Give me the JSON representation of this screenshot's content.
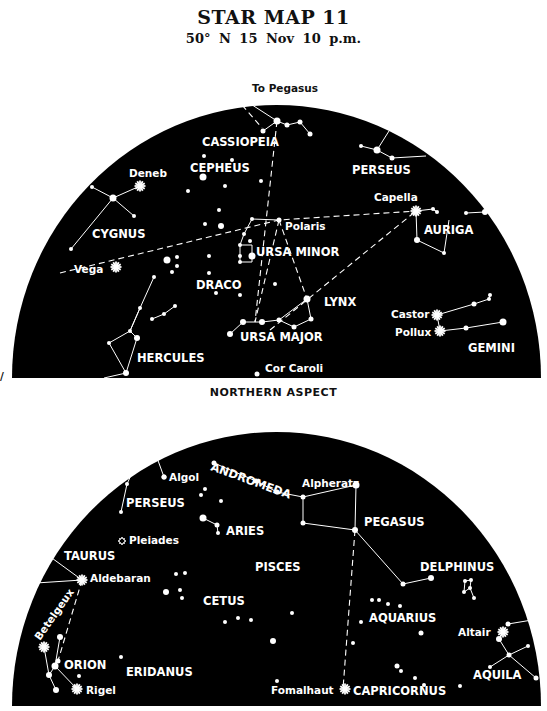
{
  "header": {
    "title": "STAR MAP 11",
    "subtitle": "50° N   15 Nov   10 p.m."
  },
  "colors": {
    "sky": "#000000",
    "star": "#ffffff",
    "paper": "#ffffff",
    "ink": "#111111"
  },
  "northern": {
    "aspect_label": "NORTHERN ASPECT",
    "dome": {
      "left": 12,
      "right": 541,
      "top": 105,
      "bottom": 378
    },
    "pointer_label": "To Pegasus",
    "constellations": [
      {
        "name": "CASSIOPEIA",
        "x": 202,
        "y": 146
      },
      {
        "name": "CEPHEUS",
        "x": 190,
        "y": 172
      },
      {
        "name": "PERSEUS",
        "x": 352,
        "y": 174
      },
      {
        "name": "CYGNUS",
        "x": 92,
        "y": 238
      },
      {
        "name": "AURIGA",
        "x": 424,
        "y": 234
      },
      {
        "name": "URSA MINOR",
        "x": 256,
        "y": 256
      },
      {
        "name": "DRACO",
        "x": 196,
        "y": 289
      },
      {
        "name": "LYNX",
        "x": 324,
        "y": 306
      },
      {
        "name": "URSA MAJOR",
        "x": 240,
        "y": 341
      },
      {
        "name": "HERCULES",
        "x": 137,
        "y": 362
      },
      {
        "name": "GEMINI",
        "x": 468,
        "y": 352
      }
    ],
    "named_stars": [
      {
        "name": "Deneb",
        "x": 129,
        "y": 177,
        "sx": 140,
        "sy": 186,
        "bright": true
      },
      {
        "name": "Capella",
        "x": 374,
        "y": 201,
        "sx": 416,
        "sy": 211,
        "bright": true
      },
      {
        "name": "Polaris",
        "x": 285,
        "y": 230,
        "sx": 279,
        "sy": 220,
        "bright": false
      },
      {
        "name": "Vega",
        "x": 74,
        "y": 273,
        "sx": 116,
        "sy": 267,
        "bright": true
      },
      {
        "name": "Castor",
        "x": 391,
        "y": 318,
        "sx": 437,
        "sy": 315,
        "bright": true
      },
      {
        "name": "Pollux",
        "x": 395,
        "y": 336,
        "sx": 440,
        "sy": 331,
        "bright": true
      },
      {
        "name": "Cor Caroli",
        "x": 265,
        "y": 372,
        "sx": 257,
        "sy": 374,
        "bright": false
      }
    ],
    "stars": [
      [
        277,
        121,
        3.5
      ],
      [
        263,
        131,
        2.5
      ],
      [
        287,
        125,
        2.5
      ],
      [
        300,
        122,
        2.5
      ],
      [
        310,
        134,
        2.5
      ],
      [
        204,
        156,
        2
      ],
      [
        232,
        160,
        2
      ],
      [
        203,
        177,
        3.5
      ],
      [
        225,
        186,
        2
      ],
      [
        261,
        181,
        2
      ],
      [
        188,
        191,
        2
      ],
      [
        219,
        210,
        2
      ],
      [
        205,
        224,
        2
      ],
      [
        221,
        226,
        3
      ],
      [
        361,
        146,
        2
      ],
      [
        377,
        150,
        3.5
      ],
      [
        392,
        158,
        2.5
      ],
      [
        92,
        187,
        2
      ],
      [
        113,
        198,
        3.5
      ],
      [
        134,
        216,
        2
      ],
      [
        71,
        249,
        2
      ],
      [
        433,
        209,
        2
      ],
      [
        437,
        212,
        2
      ],
      [
        466,
        213,
        2
      ],
      [
        485,
        212,
        3
      ],
      [
        417,
        240,
        3
      ],
      [
        444,
        253,
        2
      ],
      [
        252,
        219,
        2
      ],
      [
        244,
        234,
        2
      ],
      [
        240,
        245,
        2
      ],
      [
        240,
        256,
        2
      ],
      [
        252,
        256,
        3.5
      ],
      [
        240,
        262,
        2
      ],
      [
        167,
        260,
        3.5
      ],
      [
        177,
        257,
        2
      ],
      [
        177,
        266,
        2
      ],
      [
        172,
        272,
        2
      ],
      [
        209,
        256,
        2
      ],
      [
        209,
        273,
        2
      ],
      [
        216,
        293,
        2
      ],
      [
        240,
        295,
        2
      ],
      [
        250,
        241,
        2
      ],
      [
        275,
        284,
        2
      ],
      [
        307,
        299,
        3.5
      ],
      [
        311,
        319,
        2.5
      ],
      [
        294,
        327,
        2.5
      ],
      [
        279,
        320,
        2.5
      ],
      [
        262,
        322,
        3
      ],
      [
        243,
        322,
        3
      ],
      [
        230,
        334,
        3
      ],
      [
        154,
        277,
        2
      ],
      [
        140,
        308,
        2
      ],
      [
        130,
        331,
        2
      ],
      [
        175,
        306,
        2
      ],
      [
        164,
        314,
        2
      ],
      [
        152,
        319,
        2
      ],
      [
        137,
        338,
        3
      ],
      [
        109,
        343,
        2
      ],
      [
        126,
        373,
        3
      ],
      [
        490,
        295,
        2
      ],
      [
        489,
        299,
        2
      ],
      [
        474,
        304,
        2.5
      ],
      [
        503,
        322,
        3.5
      ],
      [
        466,
        328,
        2.5
      ]
    ],
    "lines": [
      [
        [
          229,
          90
        ],
        [
          277,
          121
        ]
      ],
      [
        [
          263,
          131
        ],
        [
          277,
          121
        ],
        [
          287,
          125
        ],
        [
          300,
          122
        ],
        [
          310,
          134
        ]
      ],
      [
        [
          361,
          146
        ],
        [
          377,
          150
        ],
        [
          392,
          158
        ],
        [
          426,
          156
        ]
      ],
      [
        [
          377,
          150
        ],
        [
          389,
          131
        ]
      ],
      [
        [
          92,
          187
        ],
        [
          113,
          198
        ],
        [
          140,
          186
        ]
      ],
      [
        [
          113,
          198
        ],
        [
          134,
          216
        ]
      ],
      [
        [
          113,
          198
        ],
        [
          71,
          249
        ]
      ],
      [
        [
          416,
          211
        ],
        [
          433,
          209
        ],
        [
          437,
          212
        ],
        [
          433,
          209
        ]
      ],
      [
        [
          416,
          211
        ],
        [
          417,
          240
        ],
        [
          444,
          253
        ],
        [
          449,
          220
        ]
      ],
      [
        [
          466,
          213
        ],
        [
          485,
          212
        ]
      ],
      [
        [
          279,
          220
        ],
        [
          252,
          219
        ],
        [
          244,
          234
        ],
        [
          240,
          245
        ]
      ],
      [
        [
          240,
          245
        ],
        [
          240,
          262
        ],
        [
          252,
          262
        ],
        [
          252,
          245
        ],
        [
          240,
          245
        ]
      ],
      [
        [
          154,
          277
        ],
        [
          140,
          308
        ],
        [
          130,
          331
        ],
        [
          137,
          338
        ]
      ],
      [
        [
          175,
          306
        ],
        [
          164,
          314
        ],
        [
          152,
          319
        ]
      ],
      [
        [
          109,
          343
        ],
        [
          130,
          331
        ],
        [
          140,
          308
        ]
      ],
      [
        [
          109,
          343
        ],
        [
          126,
          373
        ]
      ],
      [
        [
          137,
          338
        ],
        [
          126,
          373
        ],
        [
          104,
          378
        ]
      ],
      [
        [
          230,
          334
        ],
        [
          243,
          322
        ],
        [
          262,
          322
        ],
        [
          279,
          320
        ],
        [
          294,
          327
        ],
        [
          311,
          319
        ],
        [
          307,
          299
        ],
        [
          279,
          320
        ]
      ],
      [
        [
          437,
          315
        ],
        [
          474,
          304
        ],
        [
          489,
          299
        ],
        [
          490,
          295
        ]
      ],
      [
        [
          437,
          315
        ],
        [
          440,
          331
        ],
        [
          466,
          328
        ],
        [
          503,
          322
        ]
      ]
    ],
    "dashed_lines": [
      [
        [
          60,
          273
        ],
        [
          279,
          220
        ],
        [
          416,
          211
        ]
      ],
      [
        [
          279,
          220
        ],
        [
          255,
          322
        ]
      ],
      [
        [
          279,
          220
        ],
        [
          307,
          299
        ]
      ],
      [
        [
          270,
          330
        ],
        [
          416,
          211
        ]
      ],
      [
        [
          277,
          121
        ],
        [
          255,
          322
        ]
      ]
    ]
  },
  "southern": {
    "dome": {
      "left": 12,
      "right": 541,
      "top": 432,
      "bottom": 706
    },
    "constellations": [
      {
        "name": "PERSEUS",
        "x": 126,
        "y": 507
      },
      {
        "name": "ARIES",
        "x": 226,
        "y": 535
      },
      {
        "name": "PEGASUS",
        "x": 364,
        "y": 526
      },
      {
        "name": "TAURUS",
        "x": 64,
        "y": 560
      },
      {
        "name": "PISCES",
        "x": 255,
        "y": 571
      },
      {
        "name": "DELPHINUS",
        "x": 420,
        "y": 571
      },
      {
        "name": "CETUS",
        "x": 203,
        "y": 605
      },
      {
        "name": "AQUARIUS",
        "x": 369,
        "y": 622
      },
      {
        "name": "ORION",
        "x": 64,
        "y": 669
      },
      {
        "name": "ERIDANUS",
        "x": 126,
        "y": 676
      },
      {
        "name": "AQUILA",
        "x": 473,
        "y": 679
      },
      {
        "name": "CAPRICORNUS",
        "x": 353,
        "y": 695
      }
    ],
    "andromeda_label": {
      "name": "ANDROMEDA",
      "x": 210,
      "y": 470,
      "rotate": 20
    },
    "betelgeux_label": {
      "name": "Betelgeux",
      "x": 40,
      "y": 641,
      "rotate": -55
    },
    "named_stars": [
      {
        "name": "Algol",
        "x": 169,
        "y": 481,
        "sx": 164,
        "sy": 477,
        "bright": false
      },
      {
        "name": "Alpheratz",
        "x": 302,
        "y": 487,
        "sx": 303,
        "sy": 497,
        "bright": false
      },
      {
        "name": "Pleiades",
        "x": 129,
        "y": 544,
        "sx": 122,
        "sy": 541,
        "bright": false,
        "cluster": true
      },
      {
        "name": "Aldebaran",
        "x": 90,
        "y": 582,
        "sx": 82,
        "sy": 580,
        "bright": true
      },
      {
        "name": "Altair",
        "x": 458,
        "y": 636,
        "sx": 503,
        "sy": 632,
        "bright": true
      },
      {
        "name": "Rigel",
        "x": 86,
        "y": 694,
        "sx": 77,
        "sy": 689,
        "bright": true
      },
      {
        "name": "Fomalhaut",
        "x": 271,
        "y": 694,
        "sx": 345,
        "sy": 689,
        "bright": true
      }
    ],
    "stars": [
      [
        160,
        433,
        2
      ],
      [
        152,
        444,
        3.5
      ],
      [
        142,
        451,
        2
      ],
      [
        164,
        477,
        2.5
      ],
      [
        127,
        484,
        2
      ],
      [
        121,
        512,
        2
      ],
      [
        45,
        553,
        3
      ],
      [
        36,
        583,
        2
      ],
      [
        214,
        463,
        2.5
      ],
      [
        256,
        481,
        2.5
      ],
      [
        277,
        492,
        2.5
      ],
      [
        205,
        489,
        2
      ],
      [
        201,
        495,
        2
      ],
      [
        221,
        501,
        2
      ],
      [
        203,
        518,
        3.5
      ],
      [
        217,
        525,
        2.5
      ],
      [
        218,
        533,
        2
      ],
      [
        356,
        485,
        3.5
      ],
      [
        303,
        523,
        2.5
      ],
      [
        355,
        530,
        3
      ],
      [
        403,
        584,
        2.5
      ],
      [
        431,
        578,
        3
      ],
      [
        176,
        574,
        2
      ],
      [
        185,
        573,
        2
      ],
      [
        166,
        592,
        3
      ],
      [
        180,
        590,
        2
      ],
      [
        182,
        598,
        2
      ],
      [
        225,
        622,
        2
      ],
      [
        238,
        618,
        2
      ],
      [
        251,
        620,
        2
      ],
      [
        273,
        641,
        3
      ],
      [
        292,
        613,
        2
      ],
      [
        372,
        600,
        2
      ],
      [
        379,
        600,
        2
      ],
      [
        388,
        604,
        2
      ],
      [
        400,
        606,
        2
      ],
      [
        361,
        622,
        2
      ],
      [
        421,
        633,
        2.5
      ],
      [
        353,
        643,
        2
      ],
      [
        397,
        666,
        2.5
      ],
      [
        401,
        671,
        2
      ],
      [
        415,
        678,
        2
      ],
      [
        424,
        685,
        2
      ],
      [
        460,
        686,
        2
      ],
      [
        465,
        581,
        2
      ],
      [
        471,
        580,
        2
      ],
      [
        470,
        588,
        2
      ],
      [
        464,
        592,
        2
      ],
      [
        474,
        598,
        2
      ],
      [
        508,
        624,
        2.5
      ],
      [
        538,
        619,
        3
      ],
      [
        499,
        639,
        3
      ],
      [
        509,
        655,
        2.5
      ],
      [
        528,
        646,
        2
      ],
      [
        490,
        667,
        2
      ],
      [
        536,
        678,
        2.5
      ],
      [
        55,
        666,
        3.5
      ],
      [
        58,
        661,
        2.5
      ],
      [
        49,
        675,
        3
      ],
      [
        56,
        690,
        3
      ],
      [
        60,
        637,
        3
      ],
      [
        79,
        676,
        2
      ],
      [
        121,
        657,
        2
      ],
      [
        277,
        681,
        2
      ]
    ],
    "lines": [
      [
        [
          160,
          433
        ],
        [
          152,
          444
        ],
        [
          142,
          451
        ],
        [
          127,
          484
        ],
        [
          121,
          512
        ]
      ],
      [
        [
          152,
          444
        ],
        [
          164,
          477
        ]
      ],
      [
        [
          214,
          463
        ],
        [
          256,
          481
        ],
        [
          277,
          492
        ],
        [
          303,
          497
        ],
        [
          356,
          485
        ]
      ],
      [
        [
          303,
          497
        ],
        [
          303,
          523
        ],
        [
          355,
          530
        ],
        [
          356,
          485
        ]
      ],
      [
        [
          355,
          530
        ],
        [
          403,
          584
        ],
        [
          431,
          578
        ]
      ],
      [
        [
          203,
          518
        ],
        [
          217,
          525
        ],
        [
          218,
          533
        ]
      ],
      [
        [
          465,
          581
        ],
        [
          471,
          580
        ],
        [
          470,
          588
        ],
        [
          464,
          592
        ],
        [
          465,
          581
        ]
      ],
      [
        [
          470,
          588
        ],
        [
          474,
          598
        ]
      ],
      [
        [
          45,
          553
        ],
        [
          82,
          580
        ]
      ],
      [
        [
          36,
          583
        ],
        [
          82,
          580
        ]
      ],
      [
        [
          44,
          647
        ],
        [
          49,
          675
        ],
        [
          56,
          690
        ]
      ],
      [
        [
          55,
          666
        ],
        [
          77,
          689
        ]
      ],
      [
        [
          55,
          666
        ],
        [
          60,
          637
        ]
      ],
      [
        [
          49,
          675
        ],
        [
          55,
          666
        ]
      ],
      [
        [
          499,
          639
        ],
        [
          509,
          655
        ],
        [
          536,
          678
        ]
      ],
      [
        [
          508,
          624
        ],
        [
          538,
          619
        ]
      ],
      [
        [
          490,
          667
        ],
        [
          509,
          655
        ],
        [
          528,
          646
        ]
      ]
    ],
    "dashed_lines": [
      [
        [
          82,
          580
        ],
        [
          58,
          661
        ]
      ],
      [
        [
          355,
          530
        ],
        [
          343,
          689
        ]
      ]
    ]
  }
}
